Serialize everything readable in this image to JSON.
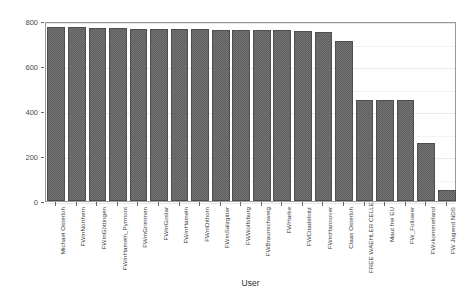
{
  "chart_data": {
    "type": "bar",
    "title": "",
    "xlabel": "User",
    "ylabel": "Number of tweets",
    "ylim": [
      0,
      800
    ],
    "yticks": [
      0,
      200,
      400,
      600,
      800
    ],
    "ytick_labels": [
      "0",
      "200",
      "400",
      "600",
      "800"
    ],
    "grid": true,
    "legend": false,
    "bar_color": "#5c5c5c",
    "panel_border_color": "#9a9a9a",
    "categories": [
      "Michael Osterloh",
      "FWmNorthern",
      "FWmGöttingen",
      "FWmHameln_Pyrmont",
      "FWmGrimmen",
      "FWmGoslar",
      "FWmHameln",
      "FWmDithom",
      "FWmSalzgitter",
      "FWWolfsburg",
      "FWBraunschweig",
      "FWHarke",
      "FWCitadelnitz",
      "FWmHannover",
      "Claas Osterloh",
      "FREE WAEHLER CELLE",
      "Maut frei EU",
      "FW_Follower",
      "FWvkommerland",
      "FW Jugend NDS"
    ],
    "values": [
      775,
      772,
      770,
      768,
      766,
      765,
      764,
      763,
      762,
      761,
      760,
      759,
      757,
      750,
      712,
      450,
      450,
      448,
      258,
      48
    ]
  }
}
